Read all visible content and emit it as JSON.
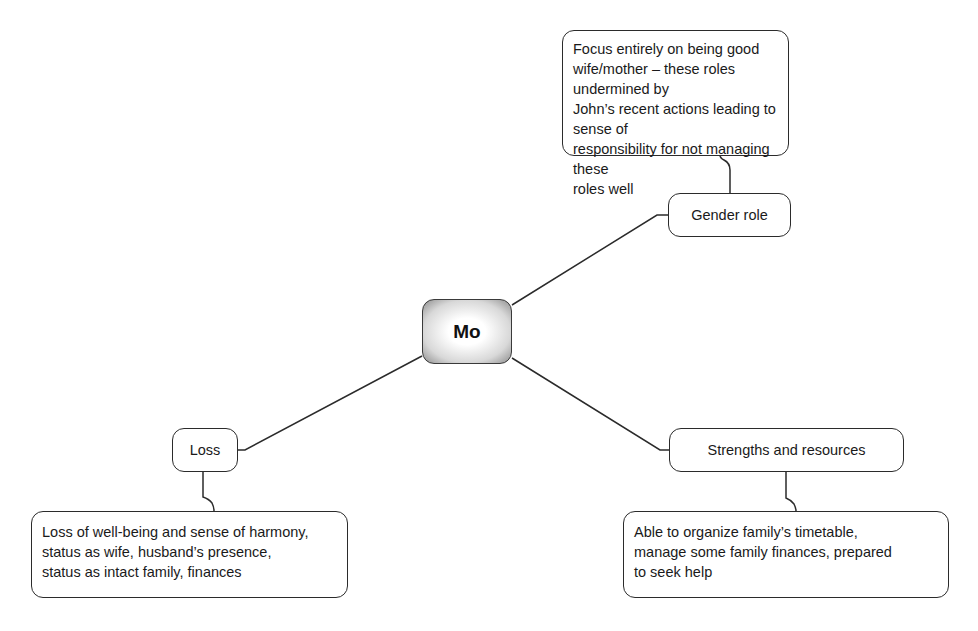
{
  "diagram": {
    "type": "mind-map",
    "central": {
      "label": "Mo"
    },
    "branches": [
      {
        "id": "gender-role",
        "label": "Gender role",
        "detail": "Focus entirely on being good wife/mother – these roles undermined by John’s recent actions leading to sense of responsibility for not managing these roles well",
        "detail_lines": [
          "Focus entirely on being good",
          "wife/mother – these roles undermined by",
          "John’s recent actions leading to sense of",
          "responsibility for not managing these",
          "roles well"
        ]
      },
      {
        "id": "strengths-and-resources",
        "label": "Strengths and resources",
        "detail": "Able to organize family’s timetable, manage some family finances, prepared to seek help",
        "detail_lines": [
          "Able to organize family’s timetable,",
          "manage some family finances, prepared",
          "to seek help"
        ]
      },
      {
        "id": "loss",
        "label": "Loss",
        "detail": "Loss of well-being and sense of harmony, status as wife, husband’s presence, status as intact family, finances",
        "detail_lines": [
          "Loss of well-being and sense of harmony,",
          "status as wife, husband’s presence,",
          "status as intact family, finances"
        ]
      }
    ],
    "colors": {
      "line": "#2b2b2b",
      "node_border": "#2b2b2b",
      "node_fill": "#ffffff",
      "central_gradient_outer": "#8e8e8e",
      "central_gradient_inner": "#ffffff"
    }
  }
}
